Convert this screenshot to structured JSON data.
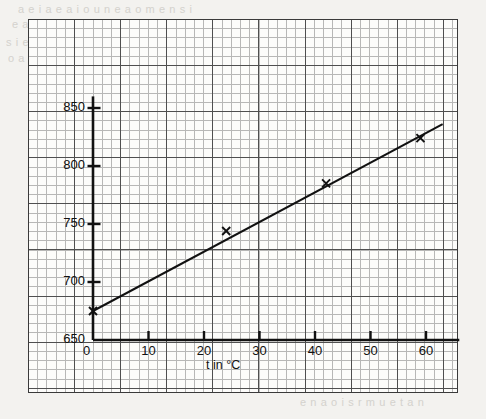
{
  "page": {
    "background_color": "#f3f2ef",
    "paper_color": "#fcfcfa",
    "ink_color": "#111111",
    "grid_fine_color": "#8d8d8d",
    "grid_bold_color": "#4a4a4a"
  },
  "bleed_through_text": {
    "line1": "a e i a e a i o u n e a o m e n s i",
    "line2": "e a n o i s e n u r a m i e o n a t e",
    "line3": "s i e n a o r m e n i s u e a o n t",
    "line4": "o a e n i s m e r a o u n t e i",
    "line5": "e n a o i s r m u e t a n"
  },
  "chart_data": {
    "type": "line",
    "title": "",
    "subtitle": "",
    "xlabel": "t in °C",
    "ylabel": "P in mm Hg",
    "xlim": [
      0,
      66
    ],
    "ylim": [
      650,
      860
    ],
    "xticks": [
      0,
      10,
      20,
      30,
      40,
      50,
      60
    ],
    "xtick_labels": [
      "0",
      "10",
      "20",
      "30",
      "40",
      "50",
      "60"
    ],
    "yticks": [
      650,
      700,
      750,
      800,
      850
    ],
    "ytick_labels": [
      "650",
      "700",
      "750",
      "800",
      "850"
    ],
    "grid": true,
    "grid_style": "graph paper, fine 1 mm squares with bold every 5th line",
    "legend": false,
    "legend_position": "none",
    "series": [
      {
        "name": "P vs t",
        "marker": "x",
        "line_color": "#111111",
        "line_width": 2,
        "x": [
          0,
          24,
          42,
          59
        ],
        "y": [
          675,
          744,
          785,
          824
        ],
        "fit_line": {
          "x_start": 0,
          "y_start": 675,
          "x_end": 63,
          "y_end": 836
        }
      }
    ],
    "annotations": []
  },
  "axes": {
    "y_axis_name": "pressure-axis",
    "x_axis_name": "temperature-axis",
    "origin_label": "0"
  }
}
